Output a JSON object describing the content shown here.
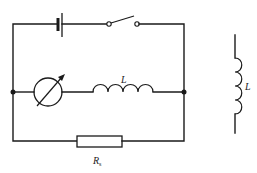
{
  "diagram": {
    "type": "circuit-schematic",
    "stroke_color": "#1a1a1a",
    "background": "#ffffff",
    "components": [
      {
        "id": "battery",
        "kind": "battery",
        "label": ""
      },
      {
        "id": "switch",
        "kind": "switch",
        "state": "open",
        "label": ""
      },
      {
        "id": "meter",
        "kind": "galvanometer",
        "label": ""
      },
      {
        "id": "inductor-main",
        "kind": "inductor",
        "label": "L"
      },
      {
        "id": "resistor",
        "kind": "resistor",
        "label": "R",
        "label_subscript": "s"
      },
      {
        "id": "inductor-standalone",
        "kind": "inductor",
        "label": "L"
      }
    ],
    "labels": {
      "inductor_main": "L",
      "resistor_main": "R",
      "resistor_sub": "s",
      "inductor_side": "L"
    },
    "junctions": 2
  }
}
